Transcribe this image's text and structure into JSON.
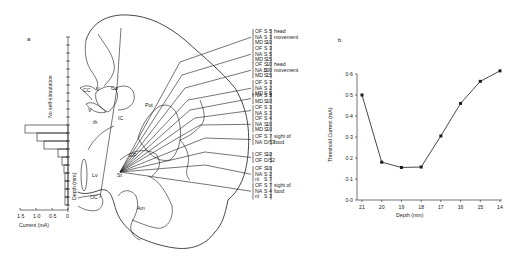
{
  "panel_a": {
    "label": "a",
    "histogram": {
      "title": "No self-stimulation",
      "ylabel": "Depth (mm)",
      "xlabel": "Current (mA)",
      "xticks": [
        "1·5",
        "1·0",
        "0·5",
        "0"
      ]
    },
    "structures": [
      "CC",
      "V",
      "Ca",
      "V",
      "th",
      "IC",
      "Put",
      "GP",
      "Lv",
      "St",
      "OC",
      "Am"
    ],
    "annotations": [
      {
        "lines": [
          [
            "OF",
            "S",
            "5"
          ],
          [
            "NA",
            "S",
            "3"
          ],
          [
            "MD",
            "S",
            "10"
          ]
        ],
        "note": "head movement"
      },
      {
        "lines": [
          [
            "OF",
            "S",
            "3"
          ],
          [
            "NA",
            "S",
            "5"
          ],
          [
            "MD",
            "S",
            "15"
          ]
        ],
        "note": ""
      },
      {
        "lines": [
          [
            "OF",
            "S",
            "10"
          ],
          [
            "NA",
            "S",
            "100"
          ],
          [
            "MD",
            "S",
            "15"
          ]
        ],
        "note": "head movement"
      },
      {
        "lines": [
          [
            "OF",
            "S",
            "3"
          ],
          [
            "NA",
            "S",
            "2"
          ],
          [
            "MD",
            "S",
            "5"
          ]
        ],
        "note": ""
      },
      {
        "lines": [
          [
            "NA",
            "S",
            "5"
          ],
          [
            "MD",
            "S",
            "10"
          ]
        ],
        "note": ""
      },
      {
        "lines": [
          [
            "OF",
            "S",
            "3"
          ],
          [
            "NA",
            "S",
            "3"
          ]
        ],
        "note": ""
      },
      {
        "lines": [
          [
            "OF",
            "S",
            "4"
          ],
          [
            "NA",
            "S",
            "10"
          ],
          [
            "MD",
            "S",
            "10"
          ]
        ],
        "note": ""
      },
      {
        "lines": [
          [
            "OF",
            "S",
            "7"
          ],
          [
            "NA",
            "D/53",
            ""
          ]
        ],
        "note": "sight of food"
      },
      {
        "lines": [
          [
            "OF",
            "S",
            "10"
          ],
          [
            "OF",
            "D/52",
            ""
          ]
        ],
        "note": ""
      },
      {
        "lines": [
          [
            "OF",
            "S",
            "10"
          ],
          [
            "NA",
            "S",
            "2"
          ],
          [
            "nl",
            "S",
            "7"
          ]
        ],
        "note": ""
      },
      {
        "lines": [
          [
            "OF",
            "S",
            "7"
          ],
          [
            "NA",
            "S",
            "4"
          ],
          [
            "nl",
            "S",
            "3"
          ]
        ],
        "note": "sight of food"
      }
    ]
  },
  "panel_b": {
    "label": "b"
  },
  "chart_data": {
    "type": "line",
    "title": "",
    "xlabel": "Depth (mm)",
    "ylabel": "Threshold Current (mA)",
    "categories": [
      "21",
      "20",
      "19",
      "18",
      "17",
      "16",
      "15",
      "14"
    ],
    "x": [
      21,
      20,
      19,
      18,
      17,
      16,
      15,
      14
    ],
    "values": [
      0.5,
      0.18,
      0.155,
      0.157,
      0.305,
      0.46,
      0.565,
      0.615
    ],
    "yticks": [
      "0·0",
      "0·1",
      "0·2",
      "0·3",
      "0·4",
      "0·5",
      "0·6"
    ],
    "ylim": [
      0,
      0.6
    ],
    "grid": false,
    "legend": null
  }
}
